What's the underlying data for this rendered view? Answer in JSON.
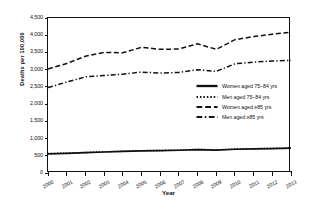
{
  "chart_data": {
    "type": "line",
    "title": "",
    "xlabel": "Year",
    "ylabel": "Deaths per 100,000",
    "x": [
      2000,
      2001,
      2002,
      2003,
      2004,
      2005,
      2006,
      2007,
      2008,
      2009,
      2010,
      2011,
      2012,
      2013
    ],
    "xtick_labels": [
      "2000",
      "2001",
      "2002",
      "2003",
      "2004",
      "2005",
      "2006",
      "2007",
      "2008",
      "2009",
      "2010",
      "2011",
      "2012",
      "2013"
    ],
    "ytick_labels": [
      "0",
      "500",
      "1,000",
      "1,500",
      "2,000",
      "2,500",
      "3,000",
      "3,500",
      "4,000",
      "4,500"
    ],
    "ytick_values": [
      0,
      500,
      1000,
      1500,
      2000,
      2500,
      3000,
      3500,
      4000,
      4500
    ],
    "ylim": [
      0,
      4500
    ],
    "xlim": [
      2000,
      2013
    ],
    "grid": false,
    "legend_position": "center-right",
    "series": [
      {
        "name": "Women aged 75–84 yrs",
        "style": "solid",
        "values": [
          555,
          570,
          590,
          610,
          625,
          645,
          650,
          660,
          680,
          665,
          690,
          700,
          710,
          720
        ]
      },
      {
        "name": "Men aged 75–84 yrs",
        "style": "dotted",
        "values": [
          565,
          575,
          595,
          615,
          630,
          648,
          655,
          665,
          685,
          670,
          695,
          705,
          715,
          725
        ]
      },
      {
        "name": "Women aged ≥85 yrs",
        "style": "dashed",
        "values": [
          3020,
          3180,
          3390,
          3500,
          3490,
          3650,
          3590,
          3600,
          3750,
          3590,
          3870,
          3960,
          4030,
          4090
        ]
      },
      {
        "name": "Men aged ≥85 yrs",
        "style": "dashdot",
        "values": [
          2480,
          2640,
          2790,
          2830,
          2870,
          2930,
          2900,
          2920,
          3000,
          2950,
          3170,
          3220,
          3250,
          3270
        ]
      }
    ]
  }
}
